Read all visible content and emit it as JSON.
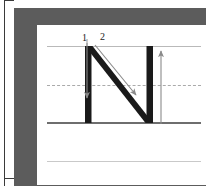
{
  "worksheet": {
    "title": "Letter N handwriting stroke-order worksheet",
    "letter": "N",
    "letter_case": "uppercase",
    "frame_color": "#5c5c5c",
    "paper_color": "#ffffff",
    "letter_color": "#1a1a1a",
    "arrow_color": "#8a8a8a"
  },
  "guides": {
    "top_line": {
      "name": "cap-height-line",
      "style": "solid",
      "color": "#b9b9b9"
    },
    "mid_line": {
      "name": "x-height-line",
      "style": "dashed",
      "color": "#aaaaaa"
    },
    "base_line": {
      "name": "baseline",
      "style": "solid",
      "color": "#6e6e6e"
    },
    "descender_line": {
      "name": "descender-line",
      "style": "solid",
      "color": "#c9c9c9"
    }
  },
  "strokes": [
    {
      "number": "1",
      "label": "1",
      "name": "stroke-1-left-vertical",
      "direction": "top-to-bottom",
      "description": "Vertical downstroke on the left side"
    },
    {
      "number": "2",
      "label": "2",
      "name": "stroke-2-diagonal-and-right-vertical",
      "direction": "diagonal-down-right-then-up",
      "description": "Diagonal down to the right, then vertical up"
    }
  ]
}
